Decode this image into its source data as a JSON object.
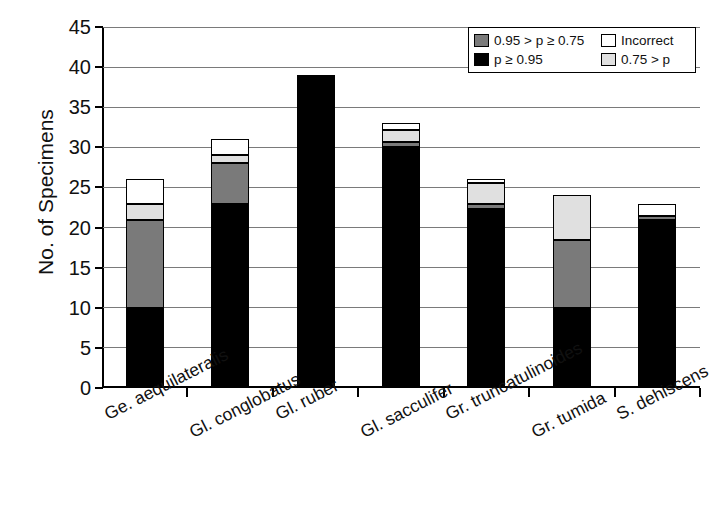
{
  "chart_data": {
    "type": "bar",
    "subtype": "stacked-bar",
    "title": "",
    "xlabel": "",
    "ylabel": "No. of Specimens",
    "ylim": [
      0,
      45
    ],
    "yticks": [
      0,
      5,
      10,
      15,
      20,
      25,
      30,
      35,
      40,
      45
    ],
    "ytick_labels": [
      "0",
      "5",
      "10",
      "15",
      "20",
      "25",
      "30",
      "35",
      "40",
      "45"
    ],
    "grid": true,
    "grid_axis": "y",
    "legend_position": "top-right",
    "categories": [
      "Ge. aequilateralis",
      "Gl. conglobatus",
      "Gl. ruber",
      "Gl. sacculifer",
      "Gr. truncatulinoides",
      "Gr. tumida",
      "S. dehiscens"
    ],
    "series": [
      {
        "name": "p ≥ 0.95",
        "color": "#000000",
        "values": [
          10,
          23,
          39,
          30,
          22.3,
          10,
          21
        ]
      },
      {
        "name": "0.95 > p ≥ 0.75",
        "color": "#7a7a7a",
        "values": [
          11,
          5,
          0,
          0.7,
          0.7,
          8.5,
          0.4
        ]
      },
      {
        "name": "0.75 > p",
        "color": "#e0e0e0",
        "values": [
          2,
          1,
          0,
          1.5,
          2.5,
          5.5,
          0
        ]
      },
      {
        "name": "Incorrect",
        "color": "#ffffff",
        "values": [
          3,
          2,
          0,
          0.8,
          0.5,
          0,
          1.6
        ]
      }
    ],
    "totals": [
      26,
      31,
      39,
      33,
      26,
      24,
      23
    ]
  },
  "legend": {
    "rows": [
      {
        "left": {
          "label": "0.95 > p ≥ 0.75",
          "color": "#7a7a7a"
        },
        "right": {
          "label": "Incorrect",
          "color": "#ffffff"
        }
      },
      {
        "left": {
          "label": "p ≥ 0.95",
          "color": "#000000"
        },
        "right": {
          "label": "0.75 > p",
          "color": "#e0e0e0"
        }
      }
    ]
  }
}
